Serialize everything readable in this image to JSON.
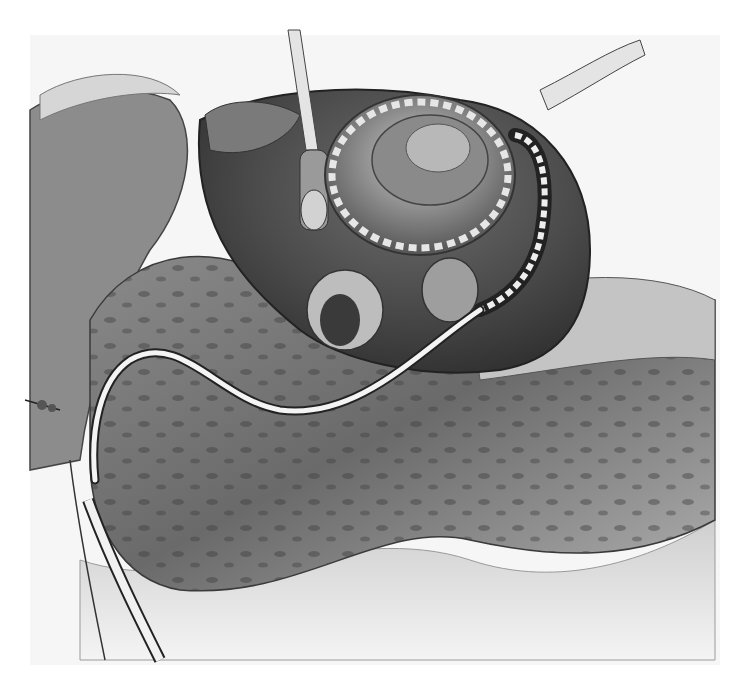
{
  "image": {
    "kind": "grayscale surgical illustration",
    "width": 731,
    "height": 696,
    "palette": {
      "background": "#ffffff",
      "paper": "#f4f4f4",
      "tissue_light": "#d9d9d9",
      "tissue_mid": "#9a9a9a",
      "tissue_dark": "#5a5a5a",
      "tissue_darkest": "#3a3a3a",
      "tube": "#f2f2f2",
      "outline": "#2a2a2a"
    }
  }
}
